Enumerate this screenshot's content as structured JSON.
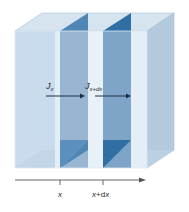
{
  "diagram": {
    "flux_in_label": {
      "main": "J",
      "sub": "x"
    },
    "flux_out_label": {
      "main": "J",
      "sub": "x+dx"
    },
    "axis": {
      "tick_1_label": "x",
      "tick_2_label": {
        "a": "x",
        "plus": "+",
        "d": "d",
        "b": "x"
      }
    },
    "colors": {
      "box_front": "#c9dced",
      "box_top": "#d6e4f0",
      "box_side": "#b3c9dd",
      "slab_1_front": "#98b6d2",
      "slab_1_dark": "#4f86b5",
      "slab_2_front": "#7ea4c8",
      "slab_2_dark": "#2f6fa3",
      "gap_light": "#e8f1f8",
      "axis": "#555555",
      "arrow": "#1f2f45"
    }
  }
}
